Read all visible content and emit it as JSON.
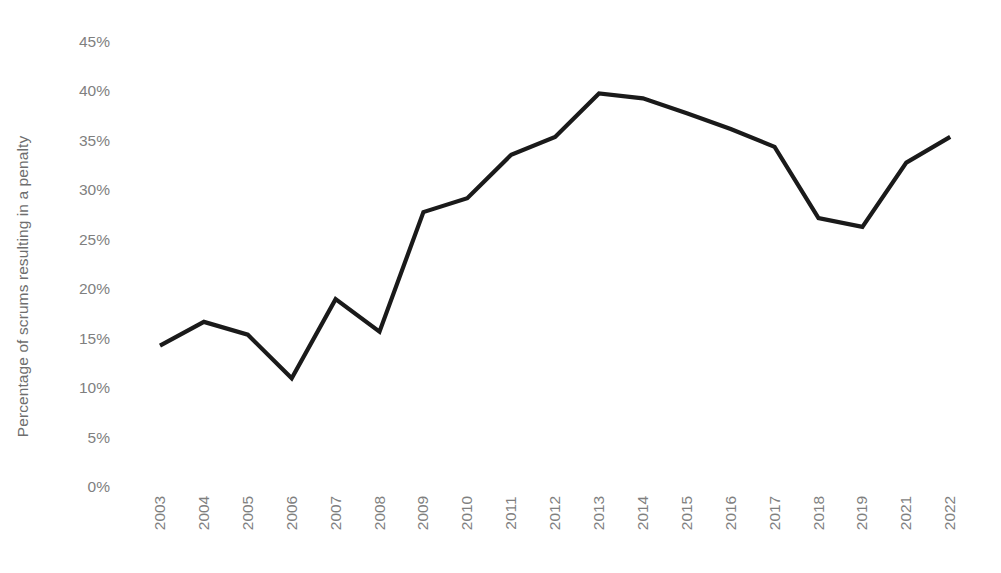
{
  "chart_data": {
    "type": "line",
    "title": "",
    "subtitle": "",
    "xlabel": "",
    "ylabel": "Percentage of scrums resulting in a penalty",
    "categories": [
      "2003",
      "2004",
      "2005",
      "2006",
      "2007",
      "2008",
      "2009",
      "2010",
      "2011",
      "2012",
      "2013",
      "2014",
      "2015",
      "2016",
      "2017",
      "2018",
      "2019",
      "2021",
      "2022"
    ],
    "values": [
      14.3,
      16.7,
      15.4,
      11.0,
      19.0,
      15.7,
      27.8,
      29.2,
      33.6,
      35.4,
      39.8,
      39.3,
      37.8,
      36.2,
      34.4,
      27.2,
      26.3,
      32.8,
      35.4
    ],
    "value_suffix": "%",
    "ylim": [
      0,
      45
    ],
    "ytick_values": [
      0,
      5,
      10,
      15,
      20,
      25,
      30,
      35,
      40,
      45
    ],
    "ytick_labels": [
      "0%",
      "5%",
      "10%",
      "15%",
      "20%",
      "25%",
      "30%",
      "35%",
      "40%",
      "45%"
    ],
    "grid": false,
    "legend": false,
    "legend_position": "none",
    "series": [
      {
        "name": "Percentage of scrums resulting in a penalty",
        "values": [
          14.3,
          16.7,
          15.4,
          11.0,
          19.0,
          15.7,
          27.8,
          29.2,
          33.6,
          35.4,
          39.8,
          39.3,
          37.8,
          36.2,
          34.4,
          27.2,
          26.3,
          32.8,
          35.4
        ]
      }
    ]
  },
  "colors": {
    "line": "#1a1a1a",
    "tick_label": "#7f7f7f",
    "axis_title": "#6e6e6e",
    "background": "#ffffff"
  }
}
